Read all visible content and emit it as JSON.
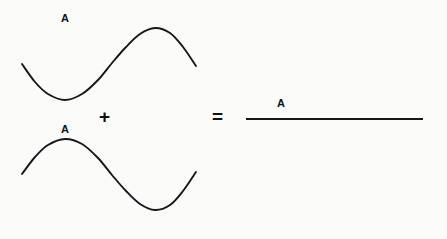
{
  "figure": {
    "background_color": "#fbfbfa",
    "stroke_color": "#17171a"
  },
  "labels": {
    "wave_top_amplitude": "A",
    "wave_bottom_amplitude": "A",
    "result_amplitude": "A"
  },
  "operators": {
    "plus": "+",
    "equals": "="
  },
  "chart_data": {
    "type": "line",
    "xlabel": "",
    "ylabel": "",
    "grid": false,
    "legend": null,
    "axis_visible": false,
    "xlim": [
      0,
      447
    ],
    "ylim": [
      239,
      0
    ],
    "annotations": [
      {
        "text": "A",
        "x": 65,
        "y": 19,
        "role": "amplitude-label-top-wave"
      },
      {
        "text": "A",
        "x": 65,
        "y": 130,
        "role": "amplitude-label-bottom-wave"
      },
      {
        "text": "+",
        "x": 106,
        "y": 116,
        "role": "operator"
      },
      {
        "text": "=",
        "x": 220,
        "y": 116,
        "role": "operator"
      },
      {
        "text": "A",
        "x": 281,
        "y": 104,
        "role": "amplitude-label-result"
      }
    ],
    "series": [
      {
        "name": "wave-top",
        "description": "Sine wave beginning with a trough then a crest",
        "phase": "trough-first",
        "x_start": 22,
        "x_end": 196,
        "baseline_y": 64,
        "trough": {
          "x": 65,
          "y": 100
        },
        "crest": {
          "x": 155,
          "y": 28
        },
        "amplitude_px": 36,
        "points": [
          {
            "x": 22,
            "y": 64
          },
          {
            "x": 35,
            "y": 82
          },
          {
            "x": 48,
            "y": 94
          },
          {
            "x": 65,
            "y": 100
          },
          {
            "x": 82,
            "y": 94
          },
          {
            "x": 98,
            "y": 80
          },
          {
            "x": 112,
            "y": 63
          },
          {
            "x": 126,
            "y": 47
          },
          {
            "x": 140,
            "y": 34
          },
          {
            "x": 155,
            "y": 28
          },
          {
            "x": 170,
            "y": 33
          },
          {
            "x": 183,
            "y": 47
          },
          {
            "x": 196,
            "y": 66
          }
        ]
      },
      {
        "name": "wave-bottom",
        "description": "Sine wave inverted 180 degrees: crest first then trough",
        "phase": "crest-first",
        "x_start": 22,
        "x_end": 196,
        "baseline_y": 174,
        "crest": {
          "x": 65,
          "y": 139
        },
        "trough": {
          "x": 155,
          "y": 210
        },
        "amplitude_px": 36,
        "points": [
          {
            "x": 22,
            "y": 174
          },
          {
            "x": 35,
            "y": 157
          },
          {
            "x": 48,
            "y": 145
          },
          {
            "x": 65,
            "y": 139
          },
          {
            "x": 82,
            "y": 144
          },
          {
            "x": 98,
            "y": 158
          },
          {
            "x": 112,
            "y": 175
          },
          {
            "x": 126,
            "y": 191
          },
          {
            "x": 140,
            "y": 204
          },
          {
            "x": 155,
            "y": 210
          },
          {
            "x": 170,
            "y": 205
          },
          {
            "x": 183,
            "y": 191
          },
          {
            "x": 196,
            "y": 172
          }
        ]
      },
      {
        "name": "wave-result",
        "description": "Flat resultant line: the two waves cancel completely",
        "phase": "flat",
        "x_start": 246,
        "x_end": 423,
        "baseline_y": 119,
        "amplitude_px": 0,
        "points": [
          {
            "x": 246,
            "y": 119
          },
          {
            "x": 423,
            "y": 119
          }
        ]
      }
    ]
  }
}
